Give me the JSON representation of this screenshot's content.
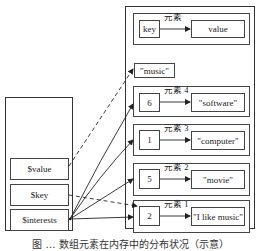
{
  "left_box": {
    "variables": [
      {
        "name": "$value"
      },
      {
        "name": "$key"
      },
      {
        "name": "$interests"
      }
    ]
  },
  "right_box": {
    "legend": {
      "key": "key",
      "label": "元素",
      "value": "value"
    },
    "standalone": {
      "value": "\"music\""
    },
    "elements": [
      {
        "label": "元素 4",
        "key": "6",
        "value": "\"software\""
      },
      {
        "label": "元素 3",
        "key": "1",
        "value": "\"computer\""
      },
      {
        "label": "元素 2",
        "key": "5",
        "value": "\"movie\""
      },
      {
        "label": "元素 1",
        "key": "2",
        "value": "\"I like music\""
      }
    ]
  },
  "arrows": [
    {
      "from": "$value",
      "to": "\"music\"",
      "style": "dashed"
    },
    {
      "from": "$key",
      "to": "元素 1 key",
      "style": "dashed"
    },
    {
      "from": "$interests",
      "to": "元素 4",
      "style": "solid"
    },
    {
      "from": "$interests",
      "to": "元素 3",
      "style": "solid"
    },
    {
      "from": "$interests",
      "to": "元素 2",
      "style": "solid"
    },
    {
      "from": "$interests",
      "to": "元素 1",
      "style": "solid"
    }
  ],
  "caption": "图 … 数组元素在内存中的分布状况（示意）",
  "colors": {
    "line": "#222222",
    "background": "#ffffff"
  }
}
